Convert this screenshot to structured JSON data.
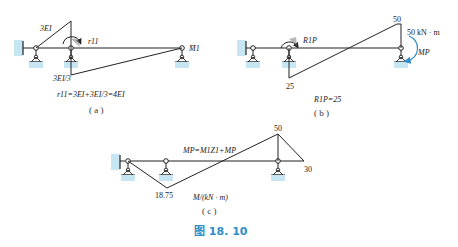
{
  "figure": {
    "caption": "图 18. 10",
    "accent_color": "#2f8fc6",
    "support_color": "#c6e6f3"
  },
  "panel_a": {
    "label": "( a )",
    "stiffness_left": "3EI",
    "stiffness_bottom": "3EI/3",
    "reaction_label": "r11",
    "moment_label": "M̄1",
    "equation": "r11=3EI+3EI/3=4EI"
  },
  "panel_b": {
    "label": "( b )",
    "value_top": "50",
    "value_bottom": "25",
    "applied_moment": "50 kN · m",
    "moment_label": "MP",
    "reaction_label": "R1P",
    "equation": "R1P=25"
  },
  "panel_c": {
    "label": "( c )",
    "value_top": "50",
    "value_right": "30",
    "value_bottom": "18.75",
    "equation": "MP=M1Z1+MP",
    "units": "M/(kN · m)"
  },
  "icons": [
    "fixed-support-icon",
    "pin-support-icon",
    "roller-support-icon",
    "moment-arrow-icon"
  ]
}
